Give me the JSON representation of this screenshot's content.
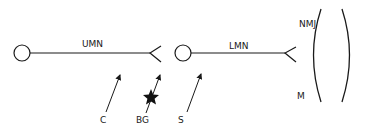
{
  "diagram": {
    "labels": {
      "umn": "UMN",
      "lmn": "LMN",
      "nmj": "NMJ",
      "muscle": "M",
      "c": "C",
      "bg": "BG",
      "s": "S"
    },
    "colors": {
      "stroke": "#1a1a1a",
      "background": "#ffffff"
    },
    "nodes": [
      {
        "id": "upper-motor-neuron-body",
        "shape": "circle"
      },
      {
        "id": "lower-motor-neuron-body",
        "shape": "circle"
      },
      {
        "id": "muscle",
        "shape": "parentheses"
      }
    ],
    "edges": [
      {
        "from": "upper-motor-neuron-body",
        "to": "lower-motor-neuron-body",
        "label": "UMN",
        "terminal": "fork"
      },
      {
        "from": "lower-motor-neuron-body",
        "to": "muscle",
        "label": "LMN",
        "terminal": "fork"
      }
    ],
    "pointers": [
      {
        "label": "C",
        "target": "umn-axon"
      },
      {
        "label": "BG",
        "target": "umn-terminal",
        "marker": "star"
      },
      {
        "label": "S",
        "target": "lmn-body"
      }
    ]
  }
}
